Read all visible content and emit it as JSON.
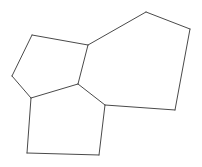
{
  "figure": {
    "width": 202,
    "height": 167,
    "background_color": "#ffffff",
    "stroke_color": "#4a4a4a",
    "stroke_width": 1,
    "fill_color": "#ffffff",
    "vertices": {
      "v_left_top": [
        32,
        35
      ],
      "v_left_far": [
        12,
        76
      ],
      "v_mid_upper": [
        88,
        45
      ],
      "v_center": [
        78,
        84
      ],
      "v_left_lower": [
        31,
        98
      ],
      "v_bottom_left": [
        27,
        153
      ],
      "v_bottom_right": [
        99,
        155
      ],
      "v_right_mid": [
        105,
        105
      ],
      "v_apex": [
        146,
        12
      ],
      "v_top_right": [
        190,
        29
      ],
      "v_right_bottom": [
        175,
        110
      ]
    },
    "faces": [
      {
        "name": "left-quadrilateral",
        "points": "32,35 88,45 78,84 31,98 12,76",
        "sides": 5
      },
      {
        "name": "bottom-pentagon",
        "points": "31,98 78,84 105,105 99,155 27,153",
        "sides": 5
      },
      {
        "name": "right-polygon",
        "points": "88,45 146,12 190,29 175,110 105,105 78,84",
        "sides": 6
      }
    ],
    "edges": [
      {
        "name": "edge-left-top-to-mid-upper",
        "points": "32,35 88,45"
      },
      {
        "name": "edge-left-top-to-left-far",
        "points": "32,35 12,76"
      },
      {
        "name": "edge-left-far-to-left-lower",
        "points": "12,76 31,98"
      },
      {
        "name": "edge-mid-upper-to-center",
        "points": "88,45 78,84"
      },
      {
        "name": "edge-center-to-left-lower",
        "points": "78,84 31,98"
      },
      {
        "name": "edge-left-lower-to-bottom-left",
        "points": "31,98 27,153"
      },
      {
        "name": "edge-bottom-left-to-bottom-right",
        "points": "27,153 99,155"
      },
      {
        "name": "edge-bottom-right-to-right-mid",
        "points": "99,155 105,105"
      },
      {
        "name": "edge-center-to-right-mid",
        "points": "78,84 105,105"
      },
      {
        "name": "edge-mid-upper-to-apex",
        "points": "88,45 146,12"
      },
      {
        "name": "edge-apex-to-top-right",
        "points": "146,12 190,29"
      },
      {
        "name": "edge-top-right-to-right-bottom",
        "points": "190,29 175,110"
      },
      {
        "name": "edge-right-bottom-to-right-mid",
        "points": "175,110 105,105"
      }
    ]
  }
}
